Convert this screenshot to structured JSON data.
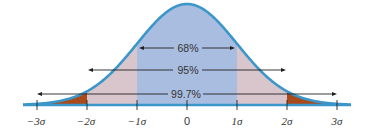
{
  "chart_data": {
    "type": "area",
    "title": "",
    "subtitle": "",
    "xlabel": "",
    "ylabel": "",
    "x_ticks": [
      "−3σ",
      "−2σ",
      "−1σ",
      "0",
      "1σ",
      "2σ",
      "3σ"
    ],
    "x_tick_values": [
      -3,
      -2,
      -1,
      0,
      1,
      2,
      3
    ],
    "xlim": [
      -3.3,
      3.3
    ],
    "grid": false,
    "legend": null,
    "regions": [
      {
        "name": "within 1σ",
        "from": -1,
        "to": 1,
        "color": "#a9bde0"
      },
      {
        "name": "between 1σ and 2σ",
        "from": -2,
        "to": -1,
        "color": "#d9c6cd"
      },
      {
        "name": "between 1σ and 2σ",
        "from": 1,
        "to": 2,
        "color": "#d9c6cd"
      },
      {
        "name": "beyond 2σ",
        "from": -3.3,
        "to": -2,
        "color": "#a84a1c"
      },
      {
        "name": "beyond 2σ",
        "from": 2,
        "to": 3.3,
        "color": "#a84a1c"
      }
    ],
    "annotations": [
      {
        "label": "68%",
        "from": -1,
        "to": 1
      },
      {
        "label": "95%",
        "from": -2,
        "to": 2
      },
      {
        "label": "99.7%",
        "from": -3,
        "to": 3
      }
    ],
    "curve_color": "#3b96c9"
  },
  "labels": {
    "pct68": "68%",
    "pct95": "95%",
    "pct997": "99.7%",
    "tick_m3": "−3σ",
    "tick_m2": "−2σ",
    "tick_m1": "−1σ",
    "tick_0": "0",
    "tick_p1": "1σ",
    "tick_p2": "2σ",
    "tick_p3": "3σ"
  }
}
